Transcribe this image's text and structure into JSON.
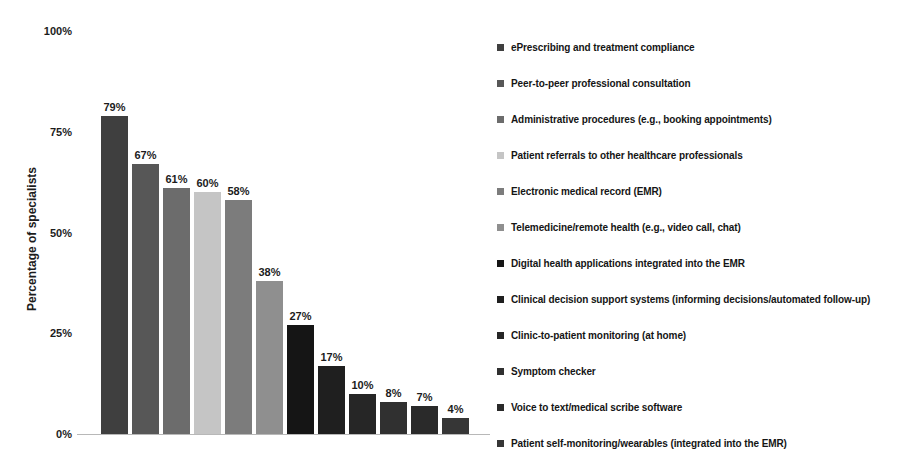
{
  "chart_data": {
    "type": "bar",
    "title": "",
    "xlabel": "",
    "ylabel": "Percentage of specialists",
    "ylim": [
      0,
      100
    ],
    "grid": false,
    "legend_position": "right",
    "yticks": [
      {
        "label": "100%",
        "value": 100
      },
      {
        "label": "75%",
        "value": 75
      },
      {
        "label": "50%",
        "value": 50
      },
      {
        "label": "25%",
        "value": 25
      },
      {
        "label": "0%",
        "value": 0
      }
    ],
    "categories": [
      "ePrescribing and treatment compliance",
      "Peer-to-peer professional consultation",
      "Administrative procedures (e.g., booking appointments)",
      "Patient referrals to other healthcare professionals",
      "Electronic medical record (EMR)",
      "Telemedicine/remote health (e.g., video call, chat)",
      "Digital health applications integrated into the EMR",
      "Clinical decision support systems (informing decisions/automated follow-up)",
      "Clinic-to-patient monitoring (at home)",
      "Symptom checker",
      "Voice to text/medical scribe software",
      "Patient self-monitoring/wearables (integrated into the EMR)"
    ],
    "values": [
      79,
      67,
      61,
      60,
      58,
      38,
      27,
      17,
      10,
      8,
      7,
      4
    ],
    "value_labels": [
      "79%",
      "67%",
      "61%",
      "60%",
      "58%",
      "38%",
      "27%",
      "17%",
      "10%",
      "8%",
      "7%",
      "4%"
    ],
    "bar_colors": [
      "#3f3f3f",
      "#575757",
      "#6c6c6c",
      "#c5c5c5",
      "#7c7c7c",
      "#8f8f8f",
      "#151515",
      "#1f1f1f",
      "#262626",
      "#303030",
      "#2a2a2a",
      "#363636"
    ],
    "colors": {
      "axis_line": "#b8b8b8",
      "label_text": "#1c1c1c"
    }
  }
}
